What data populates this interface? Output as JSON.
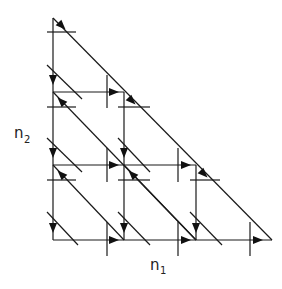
{
  "diagram": {
    "type": "lattice-flow-diagram",
    "axes": {
      "horizontal_label": "n",
      "horizontal_subscript": "1",
      "vertical_label": "n",
      "vertical_subscript": "2"
    },
    "grid_size": 4,
    "colors": {
      "line": "#1a1a1a",
      "background": "#ffffff"
    }
  }
}
